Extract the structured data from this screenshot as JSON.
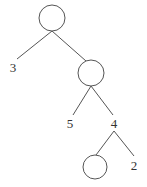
{
  "diagram": {
    "type": "tree",
    "nodes": [
      {
        "id": "root",
        "kind": "circle",
        "label": "",
        "cx": 52,
        "cy": 18,
        "r": 13
      },
      {
        "id": "leaf-3",
        "kind": "text",
        "label": "3",
        "x": 13,
        "y": 67
      },
      {
        "id": "inner",
        "kind": "circle",
        "label": "",
        "cx": 91,
        "cy": 73,
        "r": 13
      },
      {
        "id": "leaf-5",
        "kind": "text",
        "label": "5",
        "x": 70,
        "y": 123
      },
      {
        "id": "node-4",
        "kind": "text",
        "label": "4",
        "x": 114,
        "y": 123
      },
      {
        "id": "bottom",
        "kind": "circle",
        "label": "",
        "cx": 95,
        "cy": 167,
        "r": 12
      },
      {
        "id": "leaf-2",
        "kind": "text",
        "label": "2",
        "x": 134,
        "y": 165
      }
    ],
    "edges": [
      {
        "from": "root",
        "to": "leaf-3",
        "x1": 52,
        "y1": 31,
        "x2": 17,
        "y2": 59
      },
      {
        "from": "root",
        "to": "inner",
        "x1": 52,
        "y1": 31,
        "x2": 86,
        "y2": 61
      },
      {
        "from": "inner",
        "to": "leaf-5",
        "x1": 91,
        "y1": 86,
        "x2": 73,
        "y2": 115
      },
      {
        "from": "inner",
        "to": "node-4",
        "x1": 91,
        "y1": 86,
        "x2": 113,
        "y2": 115
      },
      {
        "from": "node-4",
        "to": "bottom",
        "x1": 114,
        "y1": 131,
        "x2": 96,
        "y2": 155
      },
      {
        "from": "node-4",
        "to": "leaf-2",
        "x1": 114,
        "y1": 131,
        "x2": 134,
        "y2": 156
      }
    ],
    "labels": {
      "leaf_3": "3",
      "leaf_5": "5",
      "node_4": "4",
      "leaf_2": "2"
    }
  }
}
